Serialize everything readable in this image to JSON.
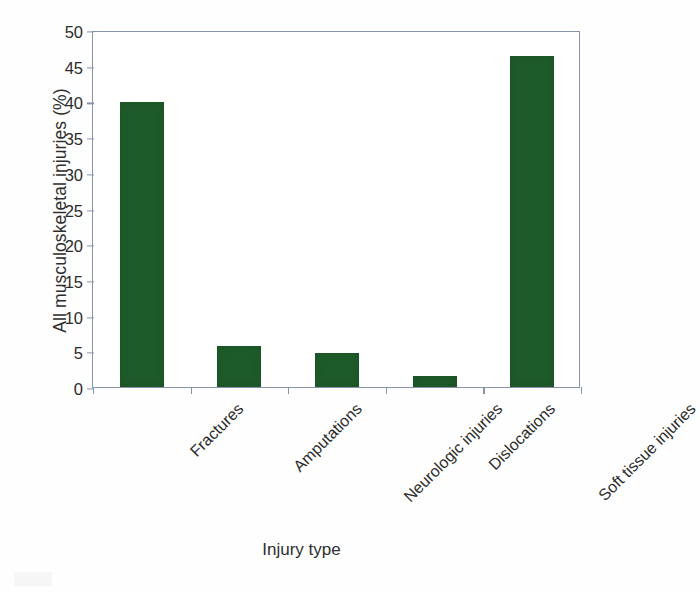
{
  "chart_data": {
    "type": "bar",
    "title": "",
    "subtitle": "",
    "xlabel": "Injury type",
    "ylabel": "All musculoskeletal injuries (%)",
    "categories": [
      "Fractures",
      "Amputations",
      "Neurologic injuries",
      "Dislocations",
      "Soft tissue injuries"
    ],
    "values": [
      39.9,
      5.7,
      4.7,
      1.6,
      46.4
    ],
    "ylim": [
      0,
      50
    ],
    "ytick_step": 5,
    "ytick_labels": [
      "50",
      "45",
      "40",
      "35",
      "30",
      "25",
      "20",
      "15",
      "10",
      "5",
      "0"
    ],
    "ytick_values": [
      50,
      45,
      40,
      35,
      30,
      25,
      20,
      15,
      10,
      5,
      0
    ],
    "grid": false,
    "legend": null,
    "legend_position": "none",
    "bar_color": "#1e5b2a",
    "frame_color": "#8a93ad",
    "xlabel_rotation": -45,
    "annotations": []
  },
  "figure": {
    "background_color": "#fefefe",
    "text_color": "#2b2b2b"
  }
}
